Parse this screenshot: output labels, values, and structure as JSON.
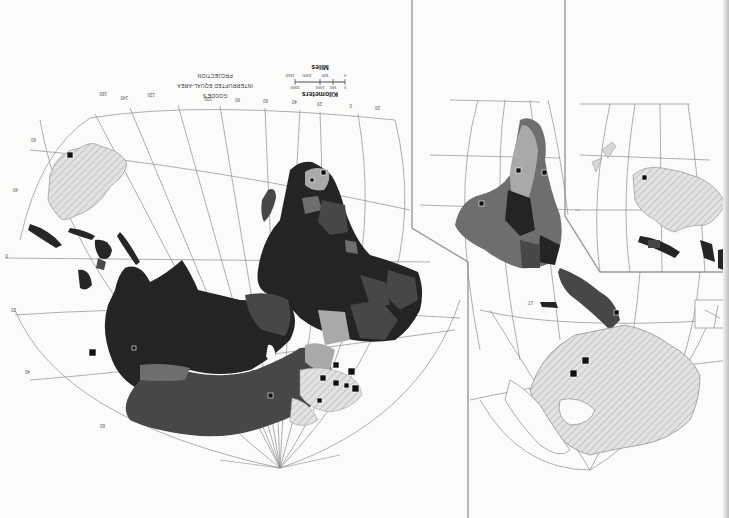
{
  "map": {
    "projection_title": [
      "GOODE'S",
      "INTERRUPTED EQUAL-AREA",
      "PROJECTION"
    ],
    "orientation": "rotated 180 degrees",
    "scale": {
      "kilometers_label": "Kilometers",
      "kilometers_ticks": [
        "0",
        "500",
        "1000",
        "2000"
      ],
      "miles_label": "Miles",
      "miles_ticks": [
        "0",
        "500",
        "1000",
        "1500"
      ]
    },
    "longitude_labels_top": [
      "160",
      "140",
      "120",
      "100",
      "80",
      "60",
      "40",
      "20",
      "0",
      "20"
    ],
    "latitude_labels": [
      "60",
      "40",
      "20",
      "0",
      "20",
      "40",
      "60"
    ],
    "right_lobe_longitude_labels": [
      "120",
      "140",
      "160",
      "180"
    ],
    "fill_colors": {
      "class_darkest": "#242424",
      "class_dark": "#474747",
      "class_mid": "#6e6e6e",
      "class_light": "#a9a9a9",
      "no_data_hatched": "#dcdcdc",
      "ocean": "#fbfbfa",
      "graticule": "#8d8d8d"
    },
    "legend_symbols": {
      "capital_marker": "black-square"
    },
    "annotation_small": "17"
  }
}
